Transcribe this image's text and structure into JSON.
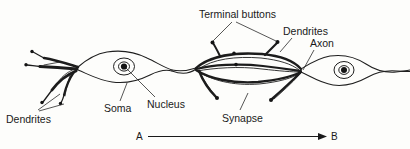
{
  "figure": {
    "background_color": "#fdfdfb",
    "ink_color": "#1a1a1a"
  },
  "labels": {
    "terminal_buttons": "Terminal buttons",
    "dendrites_right": "Dendrites",
    "axon": "Axon",
    "dendrites_left": "Dendrites",
    "soma": "Soma",
    "nucleus": "Nucleus",
    "synapse": "Synapse"
  },
  "direction_axis": {
    "start_letter": "A",
    "end_letter": "B"
  },
  "diagram_parts": [
    {
      "name": "dendrites-left",
      "label": "Dendrites"
    },
    {
      "name": "soma-left",
      "label": "Soma"
    },
    {
      "name": "nucleus-left",
      "label": "Nucleus"
    },
    {
      "name": "terminal-buttons",
      "label": "Terminal buttons"
    },
    {
      "name": "synapse",
      "label": "Synapse"
    },
    {
      "name": "dendrites-right",
      "label": "Dendrites"
    },
    {
      "name": "axon",
      "label": "Axon"
    },
    {
      "name": "soma-right",
      "label": "Soma"
    }
  ]
}
